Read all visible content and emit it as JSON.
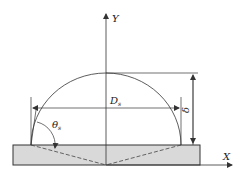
{
  "diagram": {
    "type": "sessile-droplet-geometry",
    "labels": {
      "y_axis": "Y",
      "x_axis": "X",
      "diameter": "D",
      "diameter_sub": "s",
      "height": "δ",
      "angle": "θ",
      "angle_sub": "s"
    },
    "colors": {
      "line": "#333333",
      "substrate_fill": "#d9d9d9",
      "background": "#ffffff"
    }
  }
}
